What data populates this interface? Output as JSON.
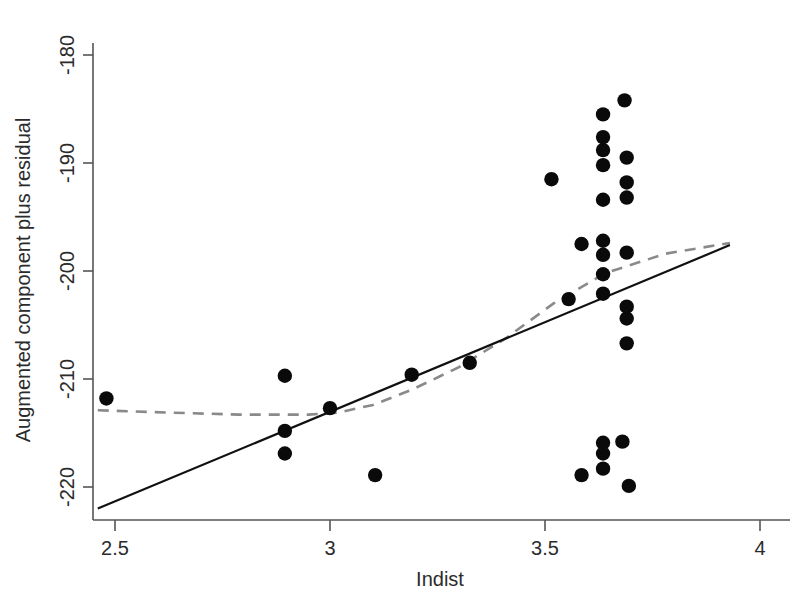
{
  "chart_data": {
    "type": "scatter",
    "title": "",
    "xlabel": "Indist",
    "ylabel": "Augmented component plus residual",
    "xlim": [
      2.44,
      4.02
    ],
    "ylim": [
      -222.5,
      -178.0
    ],
    "xticks": [
      2.5,
      3,
      3.5,
      4
    ],
    "xticklabels": [
      "2.5",
      "3",
      "3.5",
      "4"
    ],
    "yticks": [
      -180,
      -190,
      -200,
      -210,
      -220
    ],
    "yticklabels": [
      "-180",
      "-190",
      "-200",
      "-210",
      "-220"
    ],
    "grid": false,
    "legend": "none",
    "points": [
      [
        2.48,
        -211.8
      ],
      [
        2.895,
        -209.7
      ],
      [
        2.895,
        -214.8
      ],
      [
        2.895,
        -216.9
      ],
      [
        3.0,
        -212.7
      ],
      [
        3.105,
        -218.9
      ],
      [
        3.19,
        -209.6
      ],
      [
        3.325,
        -208.5
      ],
      [
        3.515,
        -191.5
      ],
      [
        3.555,
        -202.6
      ],
      [
        3.585,
        -197.5
      ],
      [
        3.585,
        -218.9
      ],
      [
        3.635,
        -185.5
      ],
      [
        3.635,
        -187.6
      ],
      [
        3.635,
        -188.8
      ],
      [
        3.635,
        -190.2
      ],
      [
        3.635,
        -193.4
      ],
      [
        3.635,
        -197.2
      ],
      [
        3.635,
        -198.5
      ],
      [
        3.635,
        -200.3
      ],
      [
        3.635,
        -202.1
      ],
      [
        3.635,
        -215.9
      ],
      [
        3.635,
        -216.9
      ],
      [
        3.635,
        -218.3
      ],
      [
        3.68,
        -215.8
      ],
      [
        3.685,
        -184.2
      ],
      [
        3.69,
        -189.5
      ],
      [
        3.69,
        -191.8
      ],
      [
        3.69,
        -193.2
      ],
      [
        3.69,
        -198.3
      ],
      [
        3.69,
        -203.3
      ],
      [
        3.69,
        -204.4
      ],
      [
        3.69,
        -206.7
      ],
      [
        3.695,
        -219.9
      ]
    ],
    "series": [
      {
        "name": "linear-fit",
        "style": "solid-black",
        "x": [
          2.46,
          3.93
        ],
        "y": [
          -222.0,
          -197.6
        ]
      },
      {
        "name": "loess-smooth",
        "style": "dashed-gray",
        "x": [
          2.46,
          2.62,
          2.79,
          2.95,
          3.02,
          3.1,
          3.19,
          3.3,
          3.41,
          3.52,
          3.64,
          3.78,
          3.93
        ],
        "y": [
          -212.9,
          -213.1,
          -213.3,
          -213.3,
          -213.1,
          -212.4,
          -211.0,
          -208.9,
          -206.2,
          -203.0,
          -200.2,
          -198.4,
          -197.4
        ]
      }
    ]
  },
  "axes": {
    "x_axis_name": "x-axis",
    "y_axis_name": "y-axis"
  }
}
